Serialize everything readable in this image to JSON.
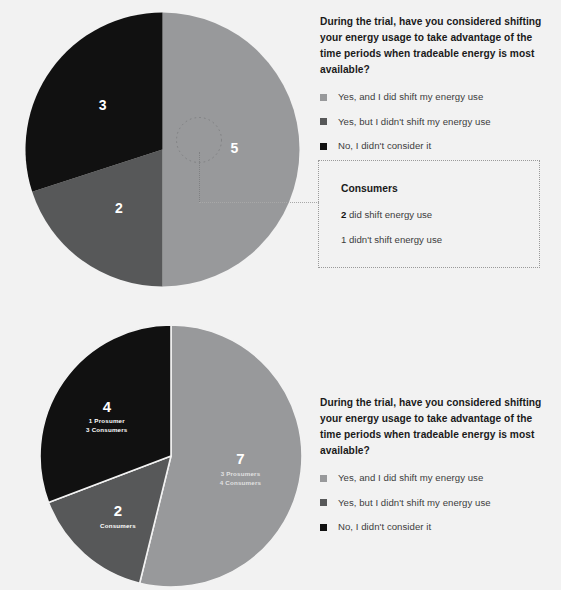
{
  "background_color": "#f2f2f2",
  "palette": {
    "light_gray": "#98999b",
    "medium_gray": "#575859",
    "black": "#111111",
    "white": "#ffffff",
    "dotted_border": "#9a9a9a"
  },
  "legend_top": {
    "question": "During the trial, have you considered shifting your energy usage to take advantage of the time periods when tradeable energy is most available?",
    "items": [
      {
        "label": "Yes, and I did shift my energy use",
        "color": "#98999b"
      },
      {
        "label": "Yes, but I didn't shift my energy use",
        "color": "#575859"
      },
      {
        "label": "No, I didn't consider it",
        "color": "#111111"
      }
    ]
  },
  "legend_bottom": {
    "question": "During the trial, have you considered shifting your energy usage to take advantage of the time periods when tradeable energy is most available?",
    "items": [
      {
        "label": "Yes, and I did shift my energy use",
        "color": "#98999b"
      },
      {
        "label": "Yes, but I didn't shift my energy use",
        "color": "#575859"
      },
      {
        "label": "No, I didn't consider it",
        "color": "#111111"
      }
    ]
  },
  "callout": {
    "title": "Consumers",
    "line1_value": "2",
    "line1_text": " did shift energy use",
    "line2_value": "1",
    "line2_text": " didn't shift energy use"
  },
  "chart_data": [
    {
      "type": "pie",
      "title": "During the trial, have you considered shifting your energy usage to take advantage of the time periods when tradeable energy is most available?",
      "id": "top-pie",
      "total": 10,
      "legend_position": "right",
      "highlighted_slice": "Yes, and I did shift my energy use",
      "categories": [
        "Yes, and I did shift my energy use",
        "Yes, but I didn't shift my energy use",
        "No, I didn't consider it"
      ],
      "values": [
        5,
        2,
        3
      ],
      "colors": [
        "#98999b",
        "#575859",
        "#111111"
      ],
      "labels": [
        "5",
        "2",
        "3"
      ],
      "sublabels": [
        "",
        "",
        ""
      ]
    },
    {
      "type": "pie",
      "title": "During the trial, have you considered shifting your energy usage to take advantage of the time periods when tradeable energy is most available?",
      "id": "bottom-pie",
      "total": 13,
      "legend_position": "right",
      "categories": [
        "Yes, and I did shift my energy use",
        "Yes, but I didn't shift my energy use",
        "No, I didn't consider it"
      ],
      "values": [
        7,
        2,
        4
      ],
      "colors": [
        "#98999b",
        "#575859",
        "#111111"
      ],
      "labels": [
        "7",
        "2",
        "4"
      ],
      "sublabels": [
        "3 Prosumers\n4 Consumers",
        "Consumers",
        "1 Prosumer\n3 Consumers"
      ]
    }
  ]
}
